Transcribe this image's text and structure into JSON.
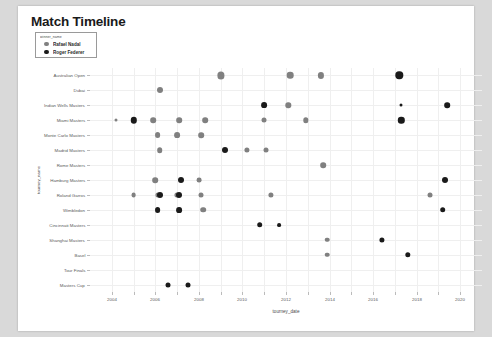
{
  "card": {
    "title": "Match Timeline"
  },
  "legend": {
    "title": "winner_name",
    "entries": [
      {
        "label": "Rafael Nadal",
        "color": "#808080",
        "key": "nadal"
      },
      {
        "label": "Roger Federer",
        "color": "#1a1a1a",
        "key": "federer"
      }
    ]
  },
  "chart_data": {
    "type": "scatter",
    "title": "Match Timeline",
    "xlabel": "tourney_date",
    "ylabel": "tourney_name",
    "xlim": [
      2003,
      2021
    ],
    "xticks": [
      2004,
      2006,
      2008,
      2010,
      2012,
      2014,
      2016,
      2018,
      2020
    ],
    "xtick_labels": [
      "2004",
      "2006",
      "2008",
      "2010",
      "2012",
      "2014",
      "2016",
      "2018",
      "2020"
    ],
    "categories": [
      "Australian Open",
      "Dubai",
      "Indian Wells Masters",
      "Miami Masters",
      "Monte Carlo Masters",
      "Madrid Masters",
      "Rome Masters",
      "Hamburg Masters",
      "Roland Garros",
      "Wimbledon",
      "Cincinnati Masters",
      "Shanghai Masters",
      "Basel",
      "Tour Finals",
      "Masters Cup"
    ],
    "grid": true,
    "legend_position": "top-left",
    "size_encodes": "match count",
    "series": [
      {
        "name": "Rafael Nadal",
        "color": "#808080",
        "points": [
          {
            "x": 2009.0,
            "y": "Australian Open",
            "size": 7.2
          },
          {
            "x": 2012.2,
            "y": "Australian Open",
            "size": 6.6
          },
          {
            "x": 2013.6,
            "y": "Australian Open",
            "size": 6.2
          },
          {
            "x": 2006.2,
            "y": "Dubai",
            "size": 6.0
          },
          {
            "x": 2012.1,
            "y": "Indian Wells Masters",
            "size": 5.4
          },
          {
            "x": 2004.2,
            "y": "Miami Masters",
            "size": 3.0
          },
          {
            "x": 2005.9,
            "y": "Miami Masters",
            "size": 5.6
          },
          {
            "x": 2007.1,
            "y": "Miami Masters",
            "size": 5.6
          },
          {
            "x": 2008.3,
            "y": "Miami Masters",
            "size": 5.6
          },
          {
            "x": 2011.0,
            "y": "Miami Masters",
            "size": 5.0
          },
          {
            "x": 2012.9,
            "y": "Miami Masters",
            "size": 5.4
          },
          {
            "x": 2006.1,
            "y": "Monte Carlo Masters",
            "size": 5.8
          },
          {
            "x": 2007.0,
            "y": "Monte Carlo Masters",
            "size": 5.8
          },
          {
            "x": 2008.1,
            "y": "Monte Carlo Masters",
            "size": 5.6
          },
          {
            "x": 2006.2,
            "y": "Madrid Masters",
            "size": 5.6
          },
          {
            "x": 2010.2,
            "y": "Madrid Masters",
            "size": 5.2
          },
          {
            "x": 2011.1,
            "y": "Madrid Masters",
            "size": 5.0
          },
          {
            "x": 2013.7,
            "y": "Rome Masters",
            "size": 5.6
          },
          {
            "x": 2006.0,
            "y": "Hamburg Masters",
            "size": 5.6
          },
          {
            "x": 2008.0,
            "y": "Hamburg Masters",
            "size": 4.8
          },
          {
            "x": 2005.0,
            "y": "Roland Garros",
            "size": 4.8
          },
          {
            "x": 2006.1,
            "y": "Roland Garros",
            "size": 5.2
          },
          {
            "x": 2007.0,
            "y": "Roland Garros",
            "size": 5.2
          },
          {
            "x": 2008.1,
            "y": "Roland Garros",
            "size": 5.0
          },
          {
            "x": 2011.3,
            "y": "Roland Garros",
            "size": 5.2
          },
          {
            "x": 2018.6,
            "y": "Roland Garros",
            "size": 5.0
          },
          {
            "x": 2008.2,
            "y": "Wimbledon",
            "size": 5.6
          },
          {
            "x": 2013.9,
            "y": "Shanghai Masters",
            "size": 4.6
          },
          {
            "x": 2013.9,
            "y": "Basel",
            "size": 4.6
          }
        ]
      },
      {
        "name": "Roger Federer",
        "color": "#1a1a1a",
        "points": [
          {
            "x": 2017.2,
            "y": "Australian Open",
            "size": 7.4
          },
          {
            "x": 2011.0,
            "y": "Indian Wells Masters",
            "size": 5.8
          },
          {
            "x": 2017.3,
            "y": "Indian Wells Masters",
            "size": 3.0
          },
          {
            "x": 2019.4,
            "y": "Indian Wells Masters",
            "size": 5.6
          },
          {
            "x": 2005.0,
            "y": "Miami Masters",
            "size": 6.4
          },
          {
            "x": 2017.3,
            "y": "Miami Masters",
            "size": 6.4
          },
          {
            "x": 2009.2,
            "y": "Madrid Masters",
            "size": 6.0
          },
          {
            "x": 2007.2,
            "y": "Hamburg Masters",
            "size": 6.0
          },
          {
            "x": 2019.3,
            "y": "Hamburg Masters",
            "size": 6.0
          },
          {
            "x": 2006.2,
            "y": "Roland Garros",
            "size": 6.0
          },
          {
            "x": 2007.1,
            "y": "Roland Garros",
            "size": 6.0
          },
          {
            "x": 2006.1,
            "y": "Wimbledon",
            "size": 5.8
          },
          {
            "x": 2007.1,
            "y": "Wimbledon",
            "size": 5.8
          },
          {
            "x": 2019.2,
            "y": "Wimbledon",
            "size": 5.6
          },
          {
            "x": 2010.8,
            "y": "Cincinnati Masters",
            "size": 5.6
          },
          {
            "x": 2011.7,
            "y": "Cincinnati Masters",
            "size": 3.8
          },
          {
            "x": 2016.4,
            "y": "Shanghai Masters",
            "size": 5.2
          },
          {
            "x": 2017.6,
            "y": "Basel",
            "size": 5.4
          },
          {
            "x": 2006.6,
            "y": "Masters Cup",
            "size": 5.0
          },
          {
            "x": 2007.5,
            "y": "Masters Cup",
            "size": 5.0
          }
        ]
      }
    ]
  }
}
